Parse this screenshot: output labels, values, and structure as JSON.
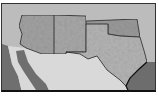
{
  "map": {
    "title": "",
    "region": "Southwestern United States",
    "style": "grayscale shaded relief",
    "labels": [],
    "colors": {
      "background": "#bdbdbd",
      "focus_land": "#9e9e9e",
      "mexico_land": "#d8d8d8",
      "water": "#6e6e6e",
      "border": "#222222",
      "frame": "#111111"
    },
    "regions": [
      {
        "name": "arizona"
      },
      {
        "name": "new-mexico"
      },
      {
        "name": "texas"
      },
      {
        "name": "oklahoma"
      },
      {
        "name": "mexico"
      },
      {
        "name": "gulf-of-mexico"
      },
      {
        "name": "gulf-of-california"
      },
      {
        "name": "pacific-ocean"
      }
    ]
  }
}
